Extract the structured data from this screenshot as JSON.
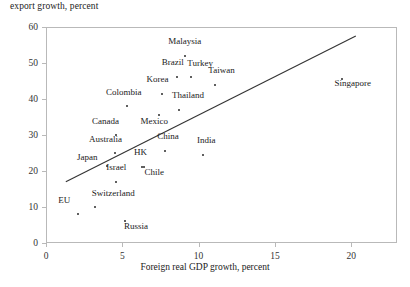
{
  "chart_data": {
    "type": "scatter",
    "title": "",
    "ylabel": "export growth, percent",
    "xlabel": "Foreign real GDP growth, percent",
    "xlim": [
      0,
      23
    ],
    "ylim": [
      0,
      60
    ],
    "xticks": [
      0,
      5,
      10,
      15,
      20
    ],
    "yticks": [
      0,
      10,
      20,
      30,
      40,
      50,
      60
    ],
    "grid": false,
    "legend": "none",
    "points": [
      {
        "label": "EU",
        "x": 2.1,
        "y": 8.0,
        "lx": 1.2,
        "ly": 10.6
      },
      {
        "label": "Switzerland",
        "x": 3.2,
        "y": 10.0,
        "lx": 4.4,
        "ly": 12.6
      },
      {
        "label": "Russia",
        "x": 5.2,
        "y": 6.0,
        "lx": 5.9,
        "ly": 3.4
      },
      {
        "label": "Israel",
        "x": 4.6,
        "y": 17.0,
        "lx": 4.6,
        "ly": 19.8
      },
      {
        "label": "Japan",
        "x": 4.0,
        "y": 21.5,
        "lx": 2.7,
        "ly": 22.6
      },
      {
        "label": "Australia",
        "x": 4.5,
        "y": 25.0,
        "lx": 3.9,
        "ly": 27.6
      },
      {
        "label": "Canada",
        "x": 4.6,
        "y": 30.0,
        "lx": 3.9,
        "ly": 32.6
      },
      {
        "label": "Colombia",
        "x": 5.3,
        "y": 38.0,
        "lx": 5.1,
        "ly": 40.6
      },
      {
        "label": "HK",
        "x": 6.3,
        "y": 21.0,
        "lx": 6.2,
        "ly": 23.8
      },
      {
        "label": "Chile",
        "x": 6.4,
        "y": 21.0,
        "lx": 7.1,
        "ly": 18.4
      },
      {
        "label": "Korea",
        "x": 7.6,
        "y": 41.5,
        "lx": 7.3,
        "ly": 44.2
      },
      {
        "label": "Mexico",
        "x": 7.4,
        "y": 35.5,
        "lx": 7.1,
        "ly": 32.6
      },
      {
        "label": "China",
        "x": 7.8,
        "y": 25.5,
        "lx": 8.0,
        "ly": 28.2
      },
      {
        "label": "Thailand",
        "x": 8.7,
        "y": 37.0,
        "lx": 9.3,
        "ly": 39.6
      },
      {
        "label": "Brazil",
        "x": 8.6,
        "y": 46.0,
        "lx": 8.3,
        "ly": 48.8
      },
      {
        "label": "Malaysia",
        "x": 9.1,
        "y": 52.0,
        "lx": 9.1,
        "ly": 54.8
      },
      {
        "label": "Turkey",
        "x": 9.5,
        "y": 46.0,
        "lx": 10.1,
        "ly": 48.6
      },
      {
        "label": "Taiwan",
        "x": 11.1,
        "y": 44.0,
        "lx": 11.5,
        "ly": 46.6
      },
      {
        "label": "India",
        "x": 10.3,
        "y": 24.5,
        "lx": 10.5,
        "ly": 27.2
      },
      {
        "label": "Singapore",
        "x": 19.4,
        "y": 45.5,
        "lx": 20.1,
        "ly": 43.0
      }
    ],
    "trendline": {
      "x0": 1.3,
      "y0": 17.0,
      "x1": 20.3,
      "y1": 57.5
    }
  }
}
